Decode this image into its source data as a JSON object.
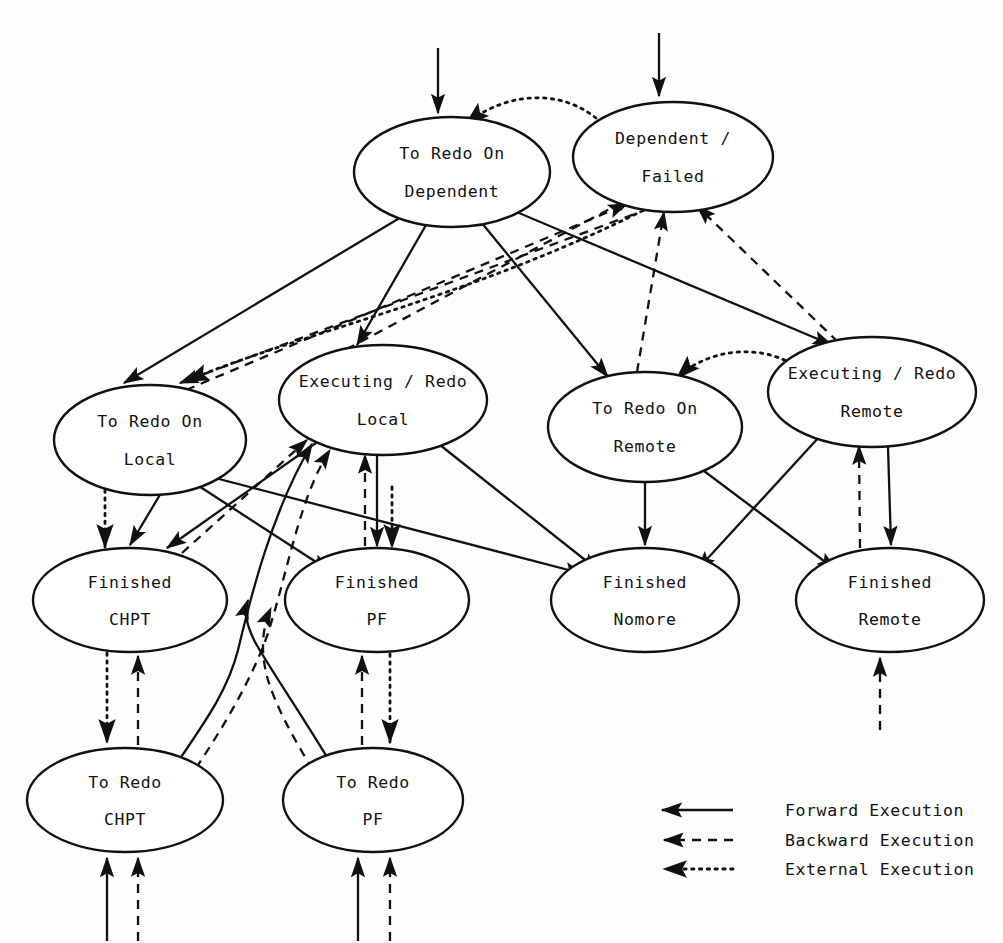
{
  "diagram": {
    "nodes": [
      {
        "id": "to_redo_on_dependent",
        "line1": "To Redo On",
        "line2": "Dependent",
        "cx": 452,
        "cy": 172,
        "rx": 98,
        "ry": 55
      },
      {
        "id": "dependent_failed",
        "line1": "Dependent /",
        "line2": "Failed",
        "cx": 673,
        "cy": 157,
        "rx": 100,
        "ry": 55
      },
      {
        "id": "to_redo_on_local",
        "line1": "To Redo On",
        "line2": "Local",
        "cx": 150,
        "cy": 440,
        "rx": 96,
        "ry": 55
      },
      {
        "id": "executing_redo_local",
        "line1": "Executing / Redo",
        "line2": "Local",
        "cx": 383,
        "cy": 400,
        "rx": 104,
        "ry": 55
      },
      {
        "id": "to_redo_on_remote",
        "line1": "To Redo On",
        "line2": "Remote",
        "cx": 645,
        "cy": 427,
        "rx": 97,
        "ry": 55
      },
      {
        "id": "executing_redo_remote",
        "line1": "Executing / Redo",
        "line2": "Remote",
        "cx": 872,
        "cy": 392,
        "rx": 104,
        "ry": 55
      },
      {
        "id": "finished_chpt",
        "line1": "Finished",
        "line2": "CHPT",
        "cx": 130,
        "cy": 600,
        "rx": 97,
        "ry": 52
      },
      {
        "id": "finished_pf",
        "line1": "Finished",
        "line2": "PF",
        "cx": 377,
        "cy": 600,
        "rx": 92,
        "ry": 52
      },
      {
        "id": "finished_nomore",
        "line1": "Finished",
        "line2": "Nomore",
        "cx": 645,
        "cy": 600,
        "rx": 94,
        "ry": 52
      },
      {
        "id": "finished_remote",
        "line1": "Finished",
        "line2": "Remote",
        "cx": 890,
        "cy": 600,
        "rx": 94,
        "ry": 52
      },
      {
        "id": "to_redo_chpt",
        "line1": "To Redo",
        "line2": "CHPT",
        "cx": 125,
        "cy": 800,
        "rx": 98,
        "ry": 52
      },
      {
        "id": "to_redo_pf",
        "line1": "To Redo",
        "line2": "PF",
        "cx": 373,
        "cy": 800,
        "rx": 90,
        "ry": 52
      }
    ],
    "edge_types": {
      "forward": "Forward Execution",
      "backward": "Backward Execution",
      "external": "External Execution"
    },
    "edges": [
      {
        "from": "entry",
        "to": "to_redo_on_dependent",
        "kind": "forward"
      },
      {
        "from": "entry",
        "to": "dependent_failed",
        "kind": "forward"
      },
      {
        "from": "dependent_failed",
        "to": "to_redo_on_dependent",
        "kind": "external"
      },
      {
        "from": "to_redo_on_dependent",
        "to": "to_redo_on_local",
        "kind": "forward"
      },
      {
        "from": "to_redo_on_dependent",
        "to": "executing_redo_local",
        "kind": "forward"
      },
      {
        "from": "to_redo_on_dependent",
        "to": "to_redo_on_remote",
        "kind": "forward"
      },
      {
        "from": "to_redo_on_dependent",
        "to": "executing_redo_remote",
        "kind": "forward"
      },
      {
        "from": "executing_redo_local",
        "to": "dependent_failed",
        "kind": "backward"
      },
      {
        "from": "to_redo_on_local",
        "to": "dependent_failed",
        "kind": "backward"
      },
      {
        "from": "to_redo_on_remote",
        "to": "dependent_failed",
        "kind": "backward"
      },
      {
        "from": "executing_redo_remote",
        "to": "dependent_failed",
        "kind": "backward"
      },
      {
        "from": "dependent_failed",
        "to": "to_redo_on_local",
        "kind": "backward"
      },
      {
        "from": "dependent_failed",
        "to": "to_redo_on_local",
        "kind": "external"
      },
      {
        "from": "executing_redo_remote",
        "to": "to_redo_on_remote",
        "kind": "external"
      },
      {
        "from": "to_redo_on_local",
        "to": "finished_chpt",
        "kind": "forward"
      },
      {
        "from": "to_redo_on_local",
        "to": "finished_pf",
        "kind": "forward"
      },
      {
        "from": "to_redo_on_local",
        "to": "finished_nomore",
        "kind": "forward"
      },
      {
        "from": "executing_redo_local",
        "to": "finished_chpt",
        "kind": "forward"
      },
      {
        "from": "executing_redo_local",
        "to": "finished_pf",
        "kind": "forward"
      },
      {
        "from": "executing_redo_local",
        "to": "finished_nomore",
        "kind": "forward"
      },
      {
        "from": "finished_chpt",
        "to": "executing_redo_local",
        "kind": "backward"
      },
      {
        "from": "finished_pf",
        "to": "executing_redo_local",
        "kind": "backward"
      },
      {
        "from": "to_redo_on_remote",
        "to": "finished_nomore",
        "kind": "forward"
      },
      {
        "from": "to_redo_on_remote",
        "to": "finished_remote",
        "kind": "forward"
      },
      {
        "from": "executing_redo_remote",
        "to": "finished_nomore",
        "kind": "forward"
      },
      {
        "from": "executing_redo_remote",
        "to": "finished_remote",
        "kind": "forward"
      },
      {
        "from": "finished_remote",
        "to": "executing_redo_remote",
        "kind": "backward"
      },
      {
        "from": "external",
        "to": "finished_chpt",
        "kind": "external"
      },
      {
        "from": "external",
        "to": "finished_pf",
        "kind": "external"
      },
      {
        "from": "finished_chpt",
        "to": "to_redo_chpt",
        "kind": "external"
      },
      {
        "from": "to_redo_chpt",
        "to": "finished_chpt",
        "kind": "backward"
      },
      {
        "from": "finished_pf",
        "to": "to_redo_pf",
        "kind": "external"
      },
      {
        "from": "to_redo_pf",
        "to": "finished_pf",
        "kind": "backward"
      },
      {
        "from": "to_redo_chpt",
        "to": "executing_redo_local",
        "kind": "forward"
      },
      {
        "from": "to_redo_pf",
        "to": "executing_redo_local",
        "kind": "forward"
      },
      {
        "from": "to_redo_chpt",
        "to": "executing_redo_local",
        "kind": "backward"
      },
      {
        "from": "to_redo_pf",
        "to": "executing_redo_local",
        "kind": "backward"
      },
      {
        "from": "entry",
        "to": "to_redo_chpt",
        "kind": "forward"
      },
      {
        "from": "entry",
        "to": "to_redo_chpt",
        "kind": "backward"
      },
      {
        "from": "entry",
        "to": "to_redo_pf",
        "kind": "forward"
      },
      {
        "from": "entry",
        "to": "to_redo_pf",
        "kind": "backward"
      },
      {
        "from": "external",
        "to": "finished_remote",
        "kind": "backward"
      }
    ]
  },
  "legend": {
    "items": [
      {
        "id": "forward",
        "label": "Forward Execution"
      },
      {
        "id": "backward",
        "label": "Backward Execution"
      },
      {
        "id": "external",
        "label": "External Execution"
      }
    ]
  },
  "colors": {
    "ink": "#111111",
    "paper": "#fdfdfc"
  }
}
